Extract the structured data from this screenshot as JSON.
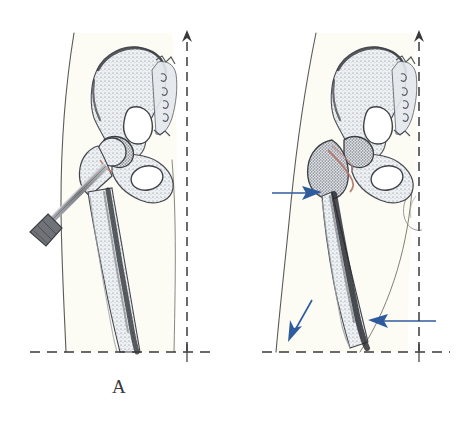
{
  "document": {
    "type": "medical-illustration",
    "title": "Hip and femur illustration, two panels",
    "background_color": "#ffffff"
  },
  "panels": [
    {
      "id": "panel-a",
      "caption": "A",
      "subject": "hip-and-femur-with-surgical-nail",
      "elements": {
        "limb_outline": "leg-outline",
        "pelvis": "pelvis-bone",
        "femur": "femur-bone",
        "sacrum_markings": "sacral-foramina",
        "implant": "surgical-nail",
        "vertical_axis": "dashed-vertical-axis-with-arrow",
        "horizontal_axis": "dashed-horizontal-baseline"
      },
      "colors": {
        "bone": "#e9edf2",
        "limb": "#fdfcf4",
        "ink": "#4a4a4a",
        "fracture": "#b5736b",
        "implant": "#8a8a8a"
      }
    },
    {
      "id": "panel-b",
      "caption": "B",
      "subject": "hip-and-femur-with-annotation-arrows",
      "elements": {
        "limb_outline": "leg-outline",
        "pelvis": "pelvis-bone",
        "femur": "femur-bone",
        "sacrum_markings": "sacral-foramina",
        "fracture_line": "femoral-neck-fracture",
        "gluteal_fold": "gluteal-fold-detail",
        "vertical_axis": "dashed-vertical-axis-with-arrow",
        "horizontal_axis": "dashed-horizontal-baseline"
      },
      "annotations": [
        {
          "name": "arrow-upper-left",
          "direction": "right",
          "color": "#2e5b9e"
        },
        {
          "name": "arrow-shaft-distal",
          "direction": "down-left",
          "color": "#2e5b9e"
        },
        {
          "name": "arrow-lower-right",
          "direction": "left",
          "color": "#2e5b9e"
        }
      ],
      "colors": {
        "bone": "#e9edf2",
        "limb": "#fdfcf4",
        "ink": "#4a4a4a",
        "fracture": "#b5736b",
        "arrow": "#2e5b9e"
      }
    }
  ]
}
